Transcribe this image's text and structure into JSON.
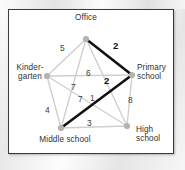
{
  "figure": {
    "title_visible": false,
    "frame_color": "#3a3a3a",
    "background_color": "#ffffff",
    "node_color": "#b3b3b3",
    "edge_color": "#cfcfcf",
    "highlight_color": "#111111"
  },
  "nodes": [
    {
      "id": "office",
      "label": "Office",
      "x": 86,
      "y": 39
    },
    {
      "id": "kinder",
      "label": "Kinder-\ngarten",
      "x": 47,
      "y": 76
    },
    {
      "id": "primary",
      "label": "Primary\nschool",
      "x": 132,
      "y": 75
    },
    {
      "id": "middle",
      "label": "Middle school",
      "x": 61,
      "y": 128
    },
    {
      "id": "high",
      "label": "High\nschool",
      "x": 127,
      "y": 126
    }
  ],
  "edges": [
    {
      "id": "office-kinder",
      "from": "office",
      "to": "kinder",
      "weight": "5",
      "bold": false,
      "lx": 60,
      "ly": 44
    },
    {
      "id": "office-primary",
      "from": "office",
      "to": "primary",
      "weight": "2",
      "bold": true,
      "lx": 113,
      "ly": 41
    },
    {
      "id": "office-middle",
      "from": "office",
      "to": "middle",
      "weight": "7",
      "bold": false,
      "lx": 71,
      "ly": 83
    },
    {
      "id": "office-high",
      "from": "office",
      "to": "high",
      "weight": "1",
      "bold": false,
      "lx": 90,
      "ly": 94
    },
    {
      "id": "kinder-primary",
      "from": "kinder",
      "to": "primary",
      "weight": "6",
      "bold": false,
      "lx": 86,
      "ly": 69
    },
    {
      "id": "kinder-middle",
      "from": "kinder",
      "to": "middle",
      "weight": "4",
      "bold": false,
      "lx": 45,
      "ly": 106
    },
    {
      "id": "kinder-high",
      "from": "kinder",
      "to": "high",
      "weight": "7",
      "bold": false,
      "lx": 78,
      "ly": 95
    },
    {
      "id": "primary-middle",
      "from": "primary",
      "to": "middle",
      "weight": "2",
      "bold": true,
      "lx": 104,
      "ly": 76
    },
    {
      "id": "primary-high",
      "from": "primary",
      "to": "high",
      "weight": "8",
      "bold": false,
      "lx": 128,
      "ly": 96
    },
    {
      "id": "middle-high",
      "from": "middle",
      "to": "high",
      "weight": "3",
      "bold": false,
      "lx": 87,
      "ly": 119
    }
  ],
  "highlight_path": [
    "office-primary",
    "office-high",
    "primary-middle",
    "middle-high"
  ]
}
